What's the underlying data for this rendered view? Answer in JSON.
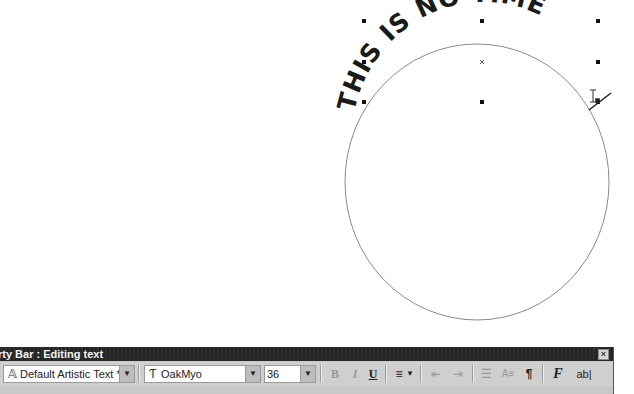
{
  "canvas": {
    "artistic_text": "THIS IS NO TIME",
    "path_shape": "ellipse",
    "ellipse": {
      "cx": 477,
      "cy": 182,
      "rx": 132,
      "ry": 138
    },
    "selection_handles": [
      [
        364,
        21
      ],
      [
        482,
        21
      ],
      [
        598,
        21
      ],
      [
        364,
        62
      ],
      [
        598,
        62
      ],
      [
        364,
        102
      ],
      [
        482,
        102
      ],
      [
        598,
        102
      ]
    ],
    "selection_center": [
      482,
      62
    ],
    "text_cursor_icon": "i-beam-cursor-icon"
  },
  "property_bar": {
    "title": "rty Bar : Editing text",
    "close_icon": "close-icon",
    "style_combo": {
      "value": "Default Artistic Text *",
      "icon": "artistic-text-style-icon"
    },
    "font_combo": {
      "value": "OakMyo",
      "icon": "truetype-font-icon"
    },
    "size_combo": {
      "value": "36"
    },
    "buttons": {
      "bold": "B",
      "italic": "I",
      "underline": "U",
      "align": "≡",
      "align_arrow": "▼",
      "indent": "⇤",
      "outdent": "⇥",
      "bullet": "☰",
      "dropcap": "A≡",
      "paragraph": "¶",
      "format_text": "F",
      "edit_text": "ab|"
    }
  }
}
